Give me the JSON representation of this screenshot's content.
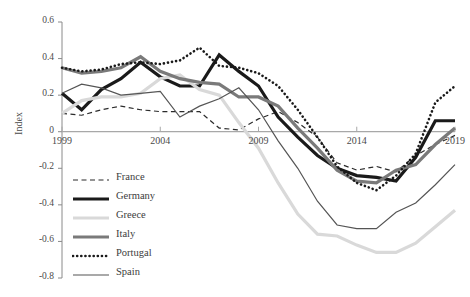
{
  "chart_data": {
    "type": "line",
    "title": "",
    "xlabel": "",
    "ylabel": "Index",
    "x": [
      1999,
      2000,
      2001,
      2002,
      2003,
      2004,
      2005,
      2006,
      2007,
      2008,
      2009,
      2010,
      2011,
      2012,
      2013,
      2014,
      2015,
      2016,
      2017,
      2018,
      2019
    ],
    "xlim": [
      1999,
      2019
    ],
    "ylim": [
      -0.8,
      0.6
    ],
    "xticks": [
      "1999",
      "2004",
      "2009",
      "2014",
      "2019"
    ],
    "xtick_values": [
      1999,
      2004,
      2009,
      2014,
      2019
    ],
    "yticks": [
      "0.6",
      "0.4",
      "0.2",
      "0",
      "-0.2",
      "-0.4",
      "-0.6",
      "-0.8"
    ],
    "ytick_values": [
      0.6,
      0.4,
      0.2,
      0,
      -0.2,
      -0.4,
      -0.6,
      -0.8
    ],
    "grid": false,
    "zero_line": true,
    "legend_position": "bottom-left",
    "series": [
      {
        "name": "France",
        "style": "dashed",
        "color": "#2b2b2b",
        "width": 1.2,
        "values": [
          0.1,
          0.09,
          0.12,
          0.14,
          0.12,
          0.11,
          0.11,
          0.11,
          0.02,
          0.01,
          0.07,
          0.11,
          0.05,
          -0.03,
          -0.17,
          -0.21,
          -0.19,
          -0.22,
          -0.13,
          -0.07,
          -0.02
        ]
      },
      {
        "name": "Germany",
        "style": "solid",
        "color": "#1a1a1a",
        "width": 3.2,
        "values": [
          0.21,
          0.12,
          0.23,
          0.29,
          0.38,
          0.3,
          0.25,
          0.25,
          0.42,
          0.33,
          0.25,
          0.08,
          -0.03,
          -0.13,
          -0.2,
          -0.24,
          -0.25,
          -0.27,
          -0.14,
          0.06,
          0.06
        ]
      },
      {
        "name": "Greece",
        "style": "solid",
        "color": "#d9d9d9",
        "width": 3.2,
        "values": [
          0.1,
          0.17,
          0.19,
          0.19,
          0.21,
          0.29,
          0.31,
          0.23,
          0.2,
          0.05,
          -0.09,
          -0.28,
          -0.45,
          -0.56,
          -0.57,
          -0.62,
          -0.66,
          -0.66,
          -0.61,
          -0.52,
          -0.43
        ]
      },
      {
        "name": "Italy",
        "style": "solid",
        "color": "#7a7a7a",
        "width": 3.2,
        "values": [
          0.35,
          0.32,
          0.33,
          0.35,
          0.41,
          0.33,
          0.29,
          0.27,
          0.26,
          0.19,
          0.19,
          0.14,
          0.02,
          -0.09,
          -0.21,
          -0.27,
          -0.28,
          -0.21,
          -0.18,
          -0.07,
          0.02
        ]
      },
      {
        "name": "Portugal",
        "style": "dotted",
        "color": "#1a1a1a",
        "width": 2.6,
        "values": [
          0.35,
          0.33,
          0.34,
          0.37,
          0.38,
          0.37,
          0.39,
          0.46,
          0.36,
          0.35,
          0.32,
          0.25,
          0.12,
          -0.03,
          -0.19,
          -0.28,
          -0.32,
          -0.24,
          -0.12,
          0.16,
          0.25
        ]
      },
      {
        "name": "Spain",
        "style": "solid",
        "color": "#555555",
        "width": 1.2,
        "values": [
          0.21,
          0.26,
          0.24,
          0.2,
          0.21,
          0.22,
          0.08,
          0.14,
          0.18,
          0.24,
          0.12,
          -0.05,
          -0.2,
          -0.38,
          -0.51,
          -0.53,
          -0.53,
          -0.44,
          -0.39,
          -0.29,
          -0.18
        ]
      }
    ]
  },
  "legend": {
    "items": [
      {
        "label": "France"
      },
      {
        "label": "Germany"
      },
      {
        "label": "Greece"
      },
      {
        "label": "Italy"
      },
      {
        "label": "Portugal"
      },
      {
        "label": "Spain"
      }
    ]
  }
}
